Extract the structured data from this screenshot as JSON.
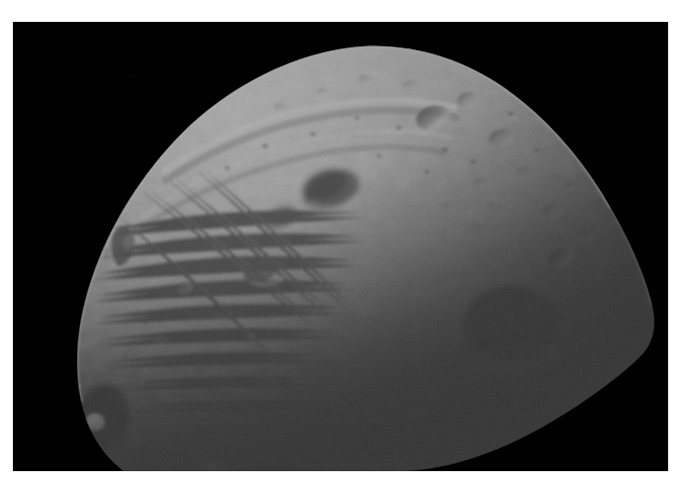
{
  "image": {
    "subject": "Phobos",
    "caption": "Phobos, the larger moon of Mars, photographed from close range by an orbiting spacecraft",
    "kind": "natural-image",
    "medium": "grayscale spacecraft photograph",
    "alt_text": "Close-up grayscale photograph of the heavily cratered, grooved moon Phobos against black space, lit from the upper left with the right and lower portions falling into deep terminator shadow",
    "orientation": "landscape",
    "width_px": 691,
    "height_px": 499
  },
  "frame": {
    "page_background": "#ffffff",
    "plate_background": "#010101",
    "plate_left_px": 13,
    "plate_top_px": 22,
    "plate_width_px": 655,
    "plate_height_px": 449
  },
  "palette": {
    "space_black": "#010101",
    "terminator_shadow": "#070707",
    "regolith_dark": "#3c3c3c",
    "regolith_mid": "#8a8a8a",
    "regolith_light": "#b4b4b4",
    "limb_highlight": "#d8d8d8",
    "specular_peak": "#e8e8e8",
    "crater_floor_shadow": "#222222"
  },
  "scene": {
    "illumination": "sunlight from upper left",
    "terminator": "runs diagonally from upper right toward lower left",
    "visible_limb": "bright crescent-shaped limb along the upper and left edges",
    "features": [
      {
        "name": "grooves",
        "label": "parallel linear grooves (striations)",
        "region": "left and lower-left flank"
      },
      {
        "name": "ridge-scarp",
        "label": "curved ridge / scarp",
        "region": "upper-left shoulder"
      },
      {
        "name": "dark-crater-pair",
        "label": "dark shadowed crater pair",
        "region": "upper-center"
      },
      {
        "name": "large-shadowed-crater",
        "label": "large crater with faintly lit far rim",
        "region": "right of center, in shadow"
      },
      {
        "name": "bright-interior-mound",
        "label": "bright mound inside dark crater",
        "region": "lower-left limb"
      },
      {
        "name": "crater-field",
        "label": "dense small crater field",
        "region": "upper-right sunlit slope"
      }
    ]
  }
}
